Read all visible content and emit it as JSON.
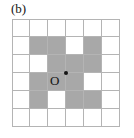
{
  "figure": {
    "panel_label": "(b)",
    "origin_label": "O",
    "colors": {
      "shaded_cell": "#a8a8a8",
      "empty_cell": "#ffffff",
      "grid_line": "#b4b4b4",
      "marker": "#141414",
      "text": "#141414"
    }
  },
  "chart_data": {
    "type": "heatmap",
    "title": "(b)",
    "xlabel": "",
    "ylabel": "",
    "grid": true,
    "legend": "none",
    "rows": 6,
    "cols": 6,
    "cell_values_note": "1 = shaded (gray) cell, 0 = empty (white) cell",
    "values": [
      [
        0,
        0,
        0,
        0,
        0,
        0
      ],
      [
        0,
        1,
        1,
        0,
        1,
        0
      ],
      [
        0,
        0,
        1,
        1,
        1,
        0
      ],
      [
        0,
        1,
        1,
        1,
        0,
        0
      ],
      [
        0,
        1,
        0,
        1,
        1,
        0
      ],
      [
        0,
        0,
        0,
        0,
        0,
        0
      ]
    ],
    "annotations": [
      {
        "text": "O",
        "role": "origin",
        "marker": "dot",
        "grid_position": "center vertex at intersection of row 3/4 and column 3/4"
      }
    ]
  }
}
